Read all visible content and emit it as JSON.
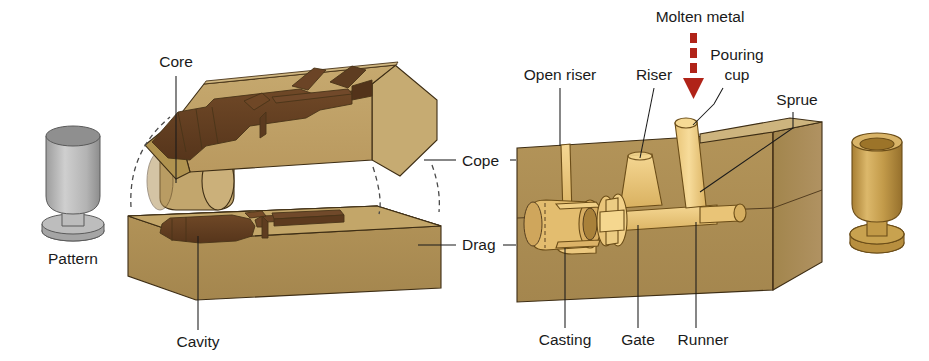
{
  "labels": {
    "pattern": "Pattern",
    "core": "Core",
    "cavity": "Cavity",
    "cope": "Cope",
    "drag": "Drag",
    "open_riser": "Open riser",
    "riser": "Riser",
    "molten_metal": "Molten metal",
    "pouring_cup": "Pouring cup",
    "pouring_cup_line1": "Pouring",
    "pouring_cup_line2": "cup",
    "sprue": "Sprue",
    "casting": "Casting",
    "gate": "Gate",
    "runner": "Runner"
  },
  "colors": {
    "sand_top": "#c0a267",
    "sand_front": "#a98c55",
    "sand_side": "#9c7f49",
    "sand_light": "#cbb27f",
    "cavity_dark": "#5c3a1e",
    "cavity_mid": "#6e4827",
    "cavity_light": "#7d5530",
    "metal_gold": "#f3d48b",
    "metal_gold_dark": "#d9b262",
    "metal_gold_deep": "#b98f3e",
    "pattern_gray_light": "#c9c9c9",
    "pattern_gray_mid": "#a9a9a9",
    "pattern_gray_dark": "#8a8a8a",
    "arrow_red": "#b02318",
    "text": "#1a1a1a",
    "background": "#ffffff"
  },
  "annotations": {
    "molten_metal_arrow": {
      "name": "molten-metal-arrow",
      "direction": "down",
      "style": "dashed",
      "dash_count": 3,
      "color": "#b02318"
    }
  }
}
